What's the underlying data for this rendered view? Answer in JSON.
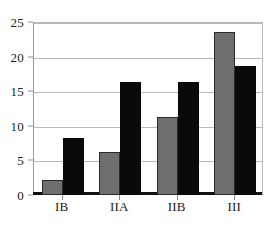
{
  "chart_data": {
    "type": "bar",
    "title": "",
    "subtitle": "",
    "xlabel": "",
    "ylabel": "",
    "categories": [
      "IB",
      "IIA",
      "IIB",
      "III"
    ],
    "series": [
      {
        "name": "series-1",
        "color": "#6e6e6e",
        "values": [
          2.2,
          6.2,
          11.3,
          23.5
        ]
      },
      {
        "name": "series-2",
        "color": "#0a0a0a",
        "values": [
          8.3,
          16.3,
          16.4,
          18.6
        ]
      }
    ],
    "ylim": [
      0,
      25
    ],
    "y_ticks": [
      0,
      5,
      10,
      15,
      20,
      25
    ],
    "y_tick_labels": [
      "0",
      "5",
      "10",
      "15",
      "20",
      "25"
    ],
    "grid": true,
    "grid_axis": "y",
    "legend": false,
    "legend_position": "none",
    "annotations": []
  },
  "axes": {
    "gridline_color": "#b9b9b9",
    "baseline_color": "#111111",
    "plot_border_color": "#b9b9b9",
    "background": "#ffffff"
  }
}
